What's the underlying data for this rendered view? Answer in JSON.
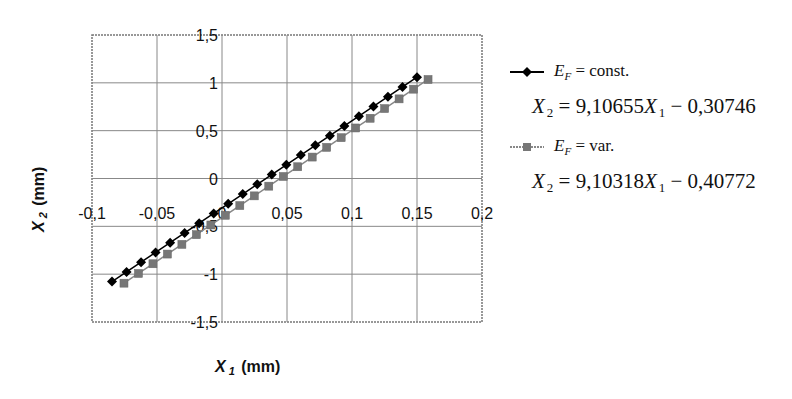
{
  "chart_data": {
    "type": "scatter",
    "title": "",
    "xlabel": "X1 (mm)",
    "ylabel": "X2 (mm)",
    "xlim": [
      -0.1,
      0.2
    ],
    "ylim": [
      -1.5,
      1.5
    ],
    "x_ticks": [
      "-0,1",
      "-0,05",
      "0",
      "0,05",
      "0,1",
      "0,15",
      "0,2"
    ],
    "y_ticks": [
      "1,5",
      "1",
      "0,5",
      "0",
      "-0,5",
      "-1",
      "-1,5"
    ],
    "grid": true,
    "legend_position": "right",
    "series": [
      {
        "name": "E_F = const.",
        "marker": "diamond",
        "color": "#000000",
        "equation": "X2 = 9,10655 X1 - 0,30746",
        "slope": 9.10655,
        "intercept": -0.30746,
        "x_range": [
          -0.0846,
          0.15
        ],
        "num_points": 22
      },
      {
        "name": "E_F = var.",
        "marker": "square",
        "color": "#808080",
        "equation": "X2 = 9,10318 X1 - 0,40772",
        "slope": 9.10318,
        "intercept": -0.40772,
        "x_range": [
          -0.0754,
          0.1585
        ],
        "num_points": 22
      }
    ]
  },
  "axes": {
    "xlabel_main": "X",
    "xlabel_sub": "1",
    "xlabel_unit": " (mm)",
    "ylabel_main": "X",
    "ylabel_sub": "2",
    "ylabel_unit": " (mm)"
  },
  "legend": {
    "items": [
      {
        "sym": "E",
        "sub": "F",
        "rest": " = const.",
        "eq_lhs": "X",
        "eq_lhs_sub": "2",
        "eq_mid": " = 9,10655",
        "eq_var": "X",
        "eq_var_sub": "1",
        "eq_rhs": " − 0,30746"
      },
      {
        "sym": "E",
        "sub": "F",
        "rest": " = var.",
        "eq_lhs": "X",
        "eq_lhs_sub": "2",
        "eq_mid": " = 9,10318",
        "eq_var": "X",
        "eq_var_sub": "1",
        "eq_rhs": " − 0,40772"
      }
    ]
  }
}
